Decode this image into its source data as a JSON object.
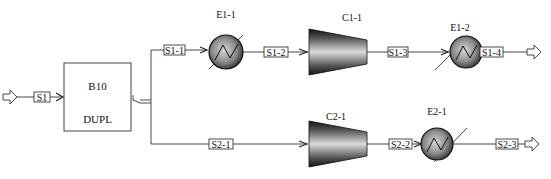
{
  "diagram": {
    "type": "process-flowsheet",
    "blocks": [
      {
        "id": "B10",
        "name": "B10",
        "type_label": "DUPL",
        "kind": "duplicator"
      },
      {
        "id": "E1-1",
        "name": "E1-1",
        "kind": "heat-exchanger"
      },
      {
        "id": "C1-1",
        "name": "C1-1",
        "kind": "compressor"
      },
      {
        "id": "E1-2",
        "name": "E1-2",
        "kind": "heat-exchanger"
      },
      {
        "id": "C2-1",
        "name": "C2-1",
        "kind": "compressor"
      },
      {
        "id": "E2-1",
        "name": "E2-1",
        "kind": "heat-exchanger"
      }
    ],
    "streams": [
      {
        "id": "S1",
        "label": "S1",
        "from": "feed",
        "to": "B10"
      },
      {
        "id": "S1-1",
        "label": "S1-1",
        "from": "B10",
        "to": "E1-1"
      },
      {
        "id": "S1-2",
        "label": "S1-2",
        "from": "E1-1",
        "to": "C1-1"
      },
      {
        "id": "S1-3",
        "label": "S1-3",
        "from": "C1-1",
        "to": "E1-2"
      },
      {
        "id": "S1-4",
        "label": "S1-4",
        "from": "E1-2",
        "to": "product"
      },
      {
        "id": "S2-1",
        "label": "S2-1",
        "from": "B10",
        "to": "C2-1"
      },
      {
        "id": "S2-2",
        "label": "S2-2",
        "from": "C2-1",
        "to": "E2-1"
      },
      {
        "id": "S2-3",
        "label": "S2-3",
        "from": "E2-1",
        "to": "product"
      }
    ]
  },
  "labels": {
    "b10_name": "B10",
    "b10_type": "DUPL",
    "e11": "E1-1",
    "c11": "C1-1",
    "e12": "E1-2",
    "c21": "C2-1",
    "e21": "E2-1",
    "s1": "S1",
    "s1_1": "S1-1",
    "s1_2": "S1-2",
    "s1_3": "S1-3",
    "s1_4": "S1-4",
    "s2_1": "S2-1",
    "s2_2": "S2-2",
    "s2_3": "S2-3"
  },
  "colors": {
    "line": "#333333",
    "background": "#ffffff",
    "equipment_dark": "#1a1a1a",
    "equipment_light": "#d0d0d0"
  }
}
